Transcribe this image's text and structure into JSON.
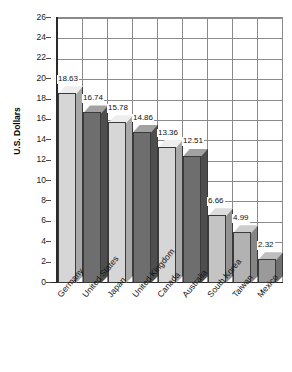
{
  "chart_data": {
    "type": "bar",
    "title": "",
    "subtitle": "",
    "xlabel": "",
    "ylabel": "U.S. Dollars",
    "ylim": [
      0,
      26
    ],
    "ytick_step": 2,
    "yticks": [
      26,
      24,
      22,
      20,
      18,
      16,
      14,
      12,
      10,
      8,
      6,
      4,
      2,
      0
    ],
    "grid": true,
    "legend": "none",
    "style_3d": true,
    "categories": [
      "Germany",
      "United States",
      "Japan",
      "United Kingdom",
      "Canada",
      "Australia",
      "South Korea",
      "Taiwan",
      "Mexico"
    ],
    "values": [
      18.63,
      16.74,
      15.78,
      14.86,
      13.36,
      12.51,
      6.66,
      4.99,
      2.32
    ],
    "data_labels": [
      "18.63",
      "16.74",
      "15.78",
      "14.86",
      "13.36",
      "12.51",
      "6.66",
      "4.99",
      "2.32"
    ],
    "bar_colors": [
      "#d6d6d6",
      "#6e6e6e",
      "#d6d6d6",
      "#6e6e6e",
      "#d6d6d6",
      "#6e6e6e",
      "#c4c4c4",
      "#b2b2b2",
      "#9a9a9a"
    ],
    "bar_top_colors": [
      "#eeeeee",
      "#a2a2a2",
      "#eeeeee",
      "#a2a2a2",
      "#eeeeee",
      "#a2a2a2",
      "#dcdcdc",
      "#cccccc",
      "#bdbdbd"
    ],
    "bar_side_colors": [
      "#a8a8a8",
      "#4e4e4e",
      "#a8a8a8",
      "#4e4e4e",
      "#a8a8a8",
      "#4e4e4e",
      "#939393",
      "#858585",
      "#707070"
    ],
    "axis_color": "#2b2b2b",
    "grid_color": "#8a8a8a",
    "background_color": "#ffffff"
  }
}
